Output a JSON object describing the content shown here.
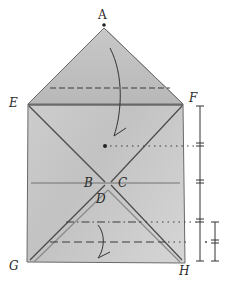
{
  "diagram": {
    "type": "origami-folding-diagram",
    "labels": {
      "A": "A",
      "B": "B",
      "C": "C",
      "D": "D",
      "E": "E",
      "F": "F",
      "G": "G",
      "H": "H"
    },
    "colors": {
      "paper": "#c9c9c9",
      "paper_light": "#dcdcdc",
      "paper_dark": "#a9a9a9",
      "ink": "#3a3a3a"
    },
    "fold_indicators": {
      "top_arrow": "fold apex A down to dot",
      "bottom_arrow": "fold bottom edge up along dashed line"
    },
    "measure_marks": {
      "right_column": "four equal divisions from F to H",
      "far_right_column": "two equal divisions in lowest quarter"
    }
  }
}
